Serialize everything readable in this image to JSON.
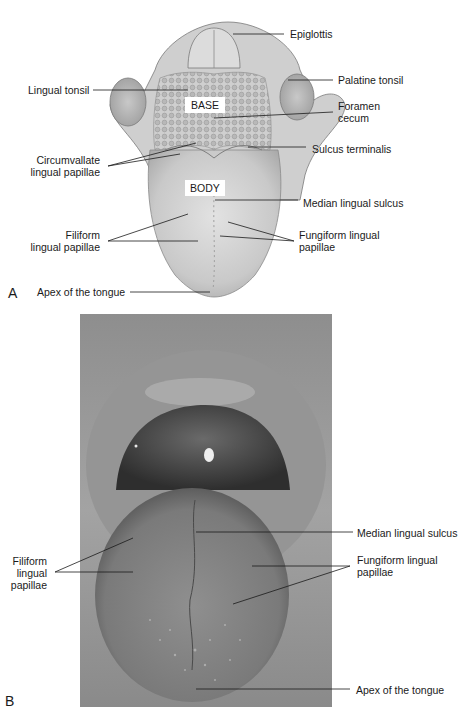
{
  "panel_a": {
    "letter": "A",
    "region_labels": {
      "base": "BASE",
      "body": "BODY"
    },
    "labels": {
      "epiglottis": "Epiglottis",
      "palatine_tonsil": "Palatine tonsil",
      "lingual_tonsil": "Lingual tonsil",
      "foramen_cecum_1": "Foramen",
      "foramen_cecum_2": "cecum",
      "sulcus_terminalis": "Sulcus terminalis",
      "circumvallate_1": "Circumvallate",
      "circumvallate_2": "lingual papillae",
      "median_lingual_sulcus": "Median lingual sulcus",
      "filiform_1": "Filiform",
      "filiform_2": "lingual papillae",
      "fungiform_1": "Fungiform lingual",
      "fungiform_2": "papillae",
      "apex": "Apex of the tongue"
    }
  },
  "panel_b": {
    "letter": "B",
    "labels": {
      "median_lingual_sulcus": "Median lingual sulcus",
      "filiform_1": "Filiform",
      "filiform_2": "lingual",
      "filiform_3": "papillae",
      "fungiform_1": "Fungiform lingual",
      "fungiform_2": "papillae",
      "apex": "Apex of the tongue"
    }
  }
}
